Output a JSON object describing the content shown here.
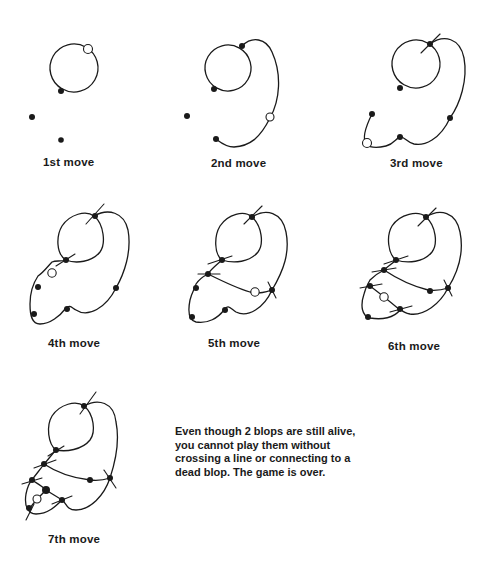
{
  "figure": {
    "panels": [
      {
        "id": "move1",
        "caption": "1st move"
      },
      {
        "id": "move2",
        "caption": "2nd move"
      },
      {
        "id": "move3",
        "caption": "3rd move"
      },
      {
        "id": "move4",
        "caption": "4th move"
      },
      {
        "id": "move5",
        "caption": "5th move"
      },
      {
        "id": "move6",
        "caption": "6th move"
      },
      {
        "id": "move7",
        "caption": "7th move"
      }
    ],
    "note": "Even though 2 blops are still alive, you cannot play them without crossing a line or connecting to a dead blop. The game is over.",
    "legend": {
      "filled_dot": "blop",
      "open_circle": "new blop added this move",
      "cross_tick": "dead blop (three connections)"
    }
  }
}
